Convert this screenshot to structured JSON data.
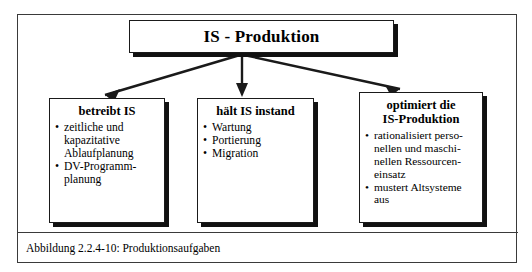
{
  "figure": {
    "caption": "Abbildung 2.2.4-10: Produktionsaufgaben",
    "root": {
      "title": "IS - Produktion"
    },
    "children": [
      {
        "title": "betreibt IS",
        "bullets": [
          "zeitliche und\nkapazitative\nAblaufplanung",
          "DV-Programm-\nplanung"
        ]
      },
      {
        "title": "hält IS instand",
        "bullets": [
          "Wartung",
          "Portierung",
          "Migration"
        ]
      },
      {
        "title": "optimiert die\nIS-Produktion",
        "bullets": [
          "rationalisiert perso-\nnellen und maschi-\nnellen Ressourcen-\neinsatz",
          "mustert Altsysteme\naus"
        ]
      }
    ],
    "bullet_glyph": "•",
    "colors": {
      "line": "#1a1a1a",
      "shadow": "#111111",
      "frame": "#3a3a3a",
      "background": "#ffffff"
    }
  }
}
